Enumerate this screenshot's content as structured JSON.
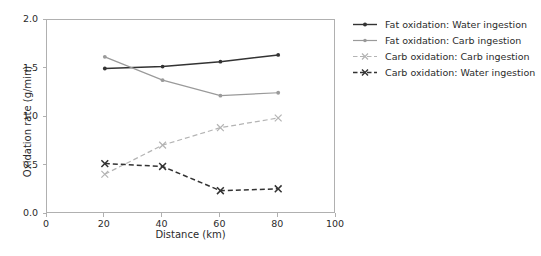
{
  "chart_data": {
    "type": "line",
    "title": "",
    "xlabel": "Distance (km)",
    "ylabel": "Oxidation rate (g/min)",
    "x": [
      20,
      40,
      60,
      80
    ],
    "xlim": [
      0,
      100
    ],
    "ylim": [
      0,
      2.0
    ],
    "xticks": [
      "0",
      "20",
      "40",
      "60",
      "80",
      "100"
    ],
    "xtick_values": [
      0,
      20,
      40,
      60,
      80,
      100
    ],
    "yticks": [
      "0.0",
      "0.5",
      "1.0",
      "1.5",
      "2.0"
    ],
    "ytick_values": [
      0.0,
      0.5,
      1.0,
      1.5,
      2.0
    ],
    "grid": false,
    "legend_position": "right-outside",
    "series": [
      {
        "name": "Fat oxidation: Water ingestion",
        "values": [
          1.5,
          1.52,
          1.57,
          1.64
        ],
        "color": "#333333",
        "linestyle": "solid",
        "marker": "dot"
      },
      {
        "name": "Fat oxidation: Carb ingestion",
        "values": [
          1.62,
          1.38,
          1.22,
          1.25
        ],
        "color": "#9a9a9a",
        "linestyle": "solid",
        "marker": "dot"
      },
      {
        "name": "Carb oxidation: Carb ingestion",
        "values": [
          0.41,
          0.71,
          0.89,
          0.99
        ],
        "color": "#b4b4b4",
        "linestyle": "dashed",
        "marker": "x"
      },
      {
        "name": "Carb oxidation: Water ingestion",
        "values": [
          0.52,
          0.49,
          0.24,
          0.26
        ],
        "color": "#333333",
        "linestyle": "dashed",
        "marker": "x"
      }
    ]
  },
  "axes": {
    "spine_color": "#b0b0b0",
    "tick_label_color": "#2b2b2b",
    "background": "#ffffff"
  },
  "legend": {
    "entries": [
      {
        "label": "Fat oxidation: Water ingestion"
      },
      {
        "label": "Fat oxidation: Carb ingestion"
      },
      {
        "label": "Carb oxidation: Carb ingestion"
      },
      {
        "label": "Carb oxidation: Water ingestion"
      }
    ]
  }
}
